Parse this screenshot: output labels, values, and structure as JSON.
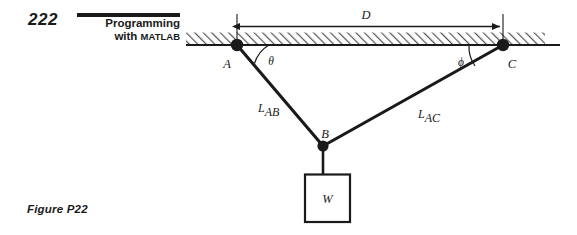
{
  "header": {
    "page_number": "222",
    "title_line1": "Programming",
    "title_line2_prefix": "with ",
    "title_line2_smallcaps": "Matlab"
  },
  "figure": {
    "caption": "Figure P22",
    "colors": {
      "ink": "#1a1a1a",
      "line": "#000000",
      "hatch": "#555555",
      "background": "#ffffff"
    },
    "labels": {
      "node_a": "A",
      "node_b": "B",
      "node_c": "C",
      "dimension_d": "D",
      "angle_theta": "θ",
      "angle_phi": "ϕ",
      "cable_ab_main": "L",
      "cable_ab_sub": "AB",
      "cable_ac_main": "L",
      "cable_ac_sub": "AC",
      "weight": "W"
    },
    "geometry": {
      "ceiling_line_y": 45,
      "ceiling_line_x_start": 186,
      "ceiling_line_x_end": 560,
      "hatch_band_top": 32,
      "hatch_band_bottom": 44,
      "node_a": [
        237,
        45
      ],
      "node_b": [
        323,
        146
      ],
      "node_c": [
        503,
        45
      ],
      "weight_box": [
        305,
        174,
        45,
        48
      ],
      "dimension_line_y": 26
    }
  }
}
